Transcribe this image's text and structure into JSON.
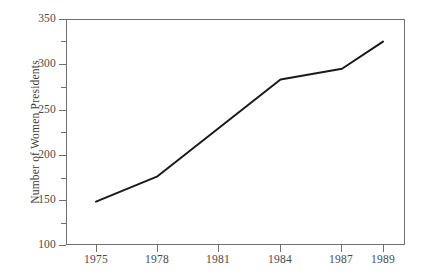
{
  "chart_data": {
    "type": "line",
    "title": "",
    "xlabel": "",
    "ylabel": "Number of Women Presidents",
    "x": [
      1975,
      1978,
      1981,
      1984,
      1987,
      1989
    ],
    "values": [
      148,
      176,
      230,
      283,
      295,
      325
    ],
    "series": [
      {
        "name": "Number of Women Presidents",
        "x": [
          1975,
          1978,
          1984,
          1987,
          1989
        ],
        "values": [
          148,
          176,
          283,
          295,
          325
        ]
      }
    ],
    "xlim": [
      1973.5,
      1990.5
    ],
    "ylim": [
      100,
      350
    ],
    "x_tick_labels": [
      "1975",
      "1978",
      "1981",
      "1984",
      "1987",
      "1989"
    ],
    "x_ticks": [
      1975,
      1978,
      1981,
      1984,
      1987,
      1989
    ],
    "y_ticks": [
      100,
      150,
      200,
      250,
      300,
      350
    ],
    "y_tick_labels": [
      "100",
      "150",
      "200",
      "250",
      "300",
      "350"
    ],
    "y_minor_ticks": [
      125,
      175,
      225,
      275,
      325
    ],
    "grid": false,
    "legend": false,
    "line_color": "#1a1a1a",
    "axis_color": "#6f6f6f",
    "background": "#ffffff"
  }
}
